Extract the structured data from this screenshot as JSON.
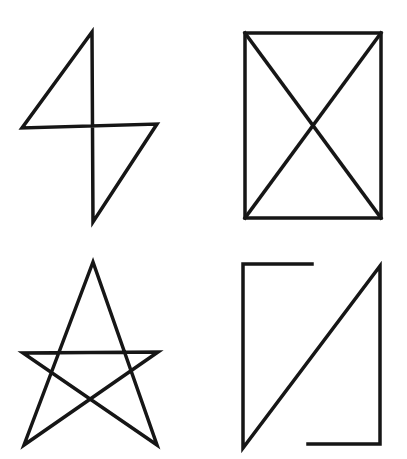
{
  "canvas": {
    "width": 407,
    "height": 459,
    "background": "#ffffff"
  },
  "stroke": {
    "color": "#161616",
    "width": 3.5
  },
  "figures": [
    {
      "id": "lightning-bolt",
      "label": "Double-triangle bolt (self-intersecting quadrilateral)",
      "strokes": [
        {
          "closed": true,
          "points": [
            [
              92,
              32
            ],
            [
              22,
              128
            ],
            [
              157,
              124
            ],
            [
              93,
              222
            ]
          ]
        }
      ]
    },
    {
      "id": "rectangle-with-x",
      "label": "Rectangle with both diagonals crossed",
      "strokes": [
        {
          "closed": true,
          "points": [
            [
              245,
              33
            ],
            [
              381,
              33
            ],
            [
              381,
              218
            ],
            [
              245,
              218
            ]
          ]
        },
        {
          "closed": false,
          "points": [
            [
              245,
              33
            ],
            [
              381,
              218
            ]
          ]
        },
        {
          "closed": false,
          "points": [
            [
              381,
              33
            ],
            [
              245,
              218
            ]
          ]
        }
      ]
    },
    {
      "id": "pentagram-star",
      "label": "Five-pointed star drawn in one stroke",
      "strokes": [
        {
          "closed": true,
          "points": [
            [
              93,
              262
            ],
            [
              157,
              445
            ],
            [
              23,
              353
            ],
            [
              158,
              352
            ],
            [
              24,
              445
            ]
          ]
        }
      ]
    },
    {
      "id": "open-rectangle-with-diagonal",
      "label": "Open rectangle with rising diagonal, gaps at top-right and bottom-left of outline",
      "strokes": [
        {
          "closed": false,
          "points": [
            [
              312,
              264
            ],
            [
              243,
              264
            ],
            [
              243,
              448
            ],
            [
              380,
              266
            ],
            [
              380,
              444
            ],
            [
              308,
              444
            ]
          ]
        }
      ]
    }
  ]
}
